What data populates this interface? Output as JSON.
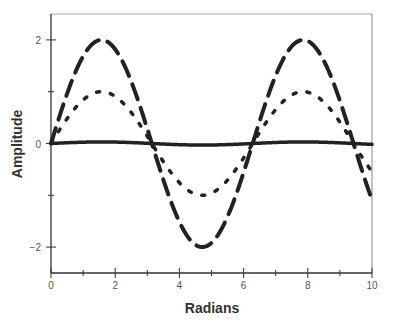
{
  "chart_data": {
    "type": "line",
    "title": "",
    "xlabel": "Radians",
    "ylabel": "Amplitude",
    "xlim": [
      0,
      10
    ],
    "ylim": [
      -2.5,
      2.5
    ],
    "x_ticks": [
      0,
      2,
      4,
      6,
      8,
      10
    ],
    "x_minor_ticks": [
      1,
      3,
      5,
      7,
      9
    ],
    "y_ticks": [
      -2,
      0,
      2
    ],
    "y_minor_ticks": [
      -1,
      1
    ],
    "grid": false,
    "legend": null,
    "x": [
      0,
      0.5,
      1,
      1.5,
      2,
      2.5,
      3,
      3.5,
      4,
      4.5,
      5,
      5.5,
      6,
      6.5,
      7,
      7.5,
      8,
      8.5,
      9,
      9.5,
      10
    ],
    "series": [
      {
        "name": "2·sin(x)",
        "style": "dashed",
        "amplitude": 2,
        "values": [
          0,
          0.96,
          1.68,
          1.99,
          1.82,
          1.2,
          0.28,
          -0.7,
          -1.51,
          -1.96,
          -1.92,
          -1.41,
          -0.56,
          0.43,
          1.31,
          1.88,
          1.98,
          1.6,
          0.82,
          -0.15,
          -1.09
        ]
      },
      {
        "name": "sin(x)",
        "style": "dotted",
        "amplitude": 1,
        "values": [
          0,
          0.48,
          0.84,
          1.0,
          0.91,
          0.6,
          0.14,
          -0.35,
          -0.76,
          -0.98,
          -0.96,
          -0.71,
          -0.28,
          0.22,
          0.66,
          0.94,
          0.99,
          0.8,
          0.41,
          -0.08,
          -0.54
        ]
      },
      {
        "name": "small sin(x)",
        "style": "solid",
        "amplitude": 0.03,
        "values": [
          0,
          0.014,
          0.025,
          0.03,
          0.027,
          0.018,
          0.004,
          -0.011,
          -0.023,
          -0.029,
          -0.029,
          -0.021,
          -0.008,
          0.006,
          0.02,
          0.028,
          0.03,
          0.024,
          0.012,
          -0.002,
          -0.016
        ]
      }
    ]
  }
}
